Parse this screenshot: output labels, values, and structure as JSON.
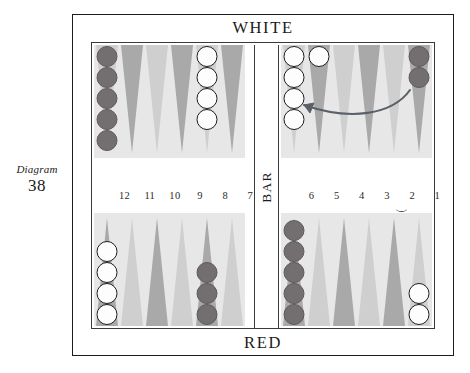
{
  "caption": {
    "word": "Diagram",
    "number": "38"
  },
  "board": {
    "top_label": "WHITE",
    "bottom_label": "RED",
    "bar_label": "BAR",
    "colors": {
      "point_light": "#cfcfcf",
      "point_dark": "#a9a9a9",
      "quadrant_background": "#e7e7e7",
      "checker_dark": "#736f70",
      "checker_white": "#fdfdfd",
      "frame": "#1c1c1c",
      "arrow": "#5a5f6b"
    },
    "point_numbers_left": [
      "12",
      "11",
      "10",
      "9",
      "8",
      "7"
    ],
    "point_numbers_right": [
      "6",
      "5",
      "4",
      "3",
      "2",
      "1"
    ],
    "quadrants": {
      "top_left": {
        "name": "white-outer-board",
        "points": [
          {
            "number": "12",
            "shade": "light",
            "checkers": 5,
            "color": "dark"
          },
          {
            "number": "11",
            "shade": "dark",
            "checkers": 0,
            "color": "none"
          },
          {
            "number": "10",
            "shade": "light",
            "checkers": 0,
            "color": "none"
          },
          {
            "number": "9",
            "shade": "dark",
            "checkers": 0,
            "color": "none"
          },
          {
            "number": "8",
            "shade": "light",
            "checkers": 4,
            "color": "white"
          },
          {
            "number": "7",
            "shade": "dark",
            "checkers": 0,
            "color": "none"
          }
        ]
      },
      "top_right": {
        "name": "white-home-board",
        "points": [
          {
            "number": "6",
            "shade": "light",
            "checkers": 4,
            "color": "white"
          },
          {
            "number": "5",
            "shade": "dark",
            "checkers": 1,
            "color": "white"
          },
          {
            "number": "4",
            "shade": "light",
            "checkers": 0,
            "color": "none"
          },
          {
            "number": "3",
            "shade": "dark",
            "checkers": 0,
            "color": "none"
          },
          {
            "number": "2",
            "shade": "light",
            "checkers": 0,
            "color": "none"
          },
          {
            "number": "1",
            "shade": "dark",
            "checkers": 2,
            "color": "dark"
          }
        ]
      },
      "bottom_left": {
        "name": "red-outer-board",
        "points": [
          {
            "number": "13",
            "shade": "dark",
            "checkers": 4,
            "color": "white"
          },
          {
            "number": "14",
            "shade": "light",
            "checkers": 0,
            "color": "none"
          },
          {
            "number": "15",
            "shade": "dark",
            "checkers": 0,
            "color": "none"
          },
          {
            "number": "16",
            "shade": "light",
            "checkers": 0,
            "color": "none"
          },
          {
            "number": "17",
            "shade": "dark",
            "checkers": 3,
            "color": "dark"
          },
          {
            "number": "18",
            "shade": "light",
            "checkers": 0,
            "color": "none"
          }
        ]
      },
      "bottom_right": {
        "name": "red-home-board",
        "points": [
          {
            "number": "19",
            "shade": "dark",
            "checkers": 5,
            "color": "dark"
          },
          {
            "number": "20",
            "shade": "light",
            "checkers": 0,
            "color": "none"
          },
          {
            "number": "21",
            "shade": "dark",
            "checkers": 0,
            "color": "none"
          },
          {
            "number": "22",
            "shade": "light",
            "checkers": 0,
            "color": "none"
          },
          {
            "number": "23",
            "shade": "dark",
            "checkers": 0,
            "color": "none"
          },
          {
            "number": "24",
            "shade": "light",
            "checkers": 2,
            "color": "white"
          }
        ]
      }
    },
    "annotations": {
      "move_arrow": {
        "from_point": "1",
        "to_point": "5",
        "description": "curved arrow from the 1-point to the 5-point"
      },
      "tick_mark": {
        "under_point": "5"
      }
    }
  }
}
